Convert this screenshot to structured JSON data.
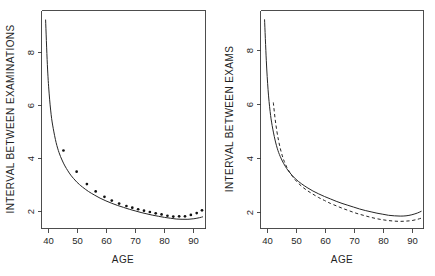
{
  "figure": {
    "kind": "two-panel-scatter-line-plot",
    "background_color": "#ffffff",
    "foreground_color": "#262626",
    "width": 435,
    "height": 276
  },
  "chart_data": [
    {
      "panel": "left",
      "type": "scatter",
      "title": "",
      "xlabel": "AGE",
      "ylabel": "INTERVAL BETWEEN EXAMINATIONS",
      "xlim": [
        36,
        92
      ],
      "ylim": [
        1.55,
        9.6
      ],
      "xticks": [
        40,
        50,
        60,
        70,
        80,
        90
      ],
      "yticks": [
        2,
        4,
        6,
        8
      ],
      "xtick_labels": [
        "40",
        "50",
        "60",
        "70",
        "80",
        "90"
      ],
      "ytick_labels": [
        "2",
        "4",
        "6",
        "8"
      ],
      "grid": false,
      "legend": "none",
      "series": [
        {
          "name": "fitted curve",
          "style": "solid-line",
          "x": [
            37.4,
            38.0,
            38.6,
            39.3,
            40.0,
            41.0,
            42.0,
            43.0,
            44.0,
            45.0,
            46.0,
            47.0,
            48.0,
            49.0,
            50.0,
            52.0,
            54.0,
            56.0,
            58.0,
            60.0,
            62.0,
            64.0,
            66.0,
            68.0,
            70.0,
            72.0,
            74.0,
            76.0,
            78.0,
            80.0,
            82.0,
            84.0,
            86.0,
            88.0,
            90.0,
            91.0
          ],
          "values": [
            9.25,
            7.6,
            6.55,
            5.75,
            5.25,
            4.72,
            4.35,
            4.08,
            3.86,
            3.68,
            3.52,
            3.39,
            3.27,
            3.17,
            3.08,
            2.92,
            2.79,
            2.67,
            2.57,
            2.48,
            2.4,
            2.33,
            2.26,
            2.2,
            2.14,
            2.09,
            2.04,
            2.0,
            1.96,
            1.93,
            1.9,
            1.89,
            1.89,
            1.91,
            1.95,
            1.98
          ]
        },
        {
          "name": "observed points",
          "style": "points",
          "x": [
            43.5,
            48.0,
            51.5,
            54.5,
            57.5,
            60.0,
            62.5,
            65.0,
            67.0,
            69.0,
            71.0,
            73.0,
            75.0,
            77.0,
            79.0,
            81.0,
            83.0,
            85.0,
            87.0,
            89.0,
            90.8
          ],
          "values": [
            4.43,
            3.65,
            3.19,
            2.92,
            2.72,
            2.58,
            2.47,
            2.38,
            2.32,
            2.26,
            2.21,
            2.16,
            2.11,
            2.07,
            2.02,
            1.99,
            2.0,
            2.0,
            2.05,
            2.12,
            2.22
          ]
        }
      ]
    },
    {
      "panel": "right",
      "type": "line",
      "title": "",
      "xlabel": "AGE",
      "ylabel": "INTERVAL BETWEEN EXAMS",
      "xlim": [
        36,
        92
      ],
      "ylim": [
        1.35,
        9.6
      ],
      "xticks": [
        40,
        50,
        60,
        70,
        80,
        90
      ],
      "yticks": [
        2,
        4,
        6,
        8
      ],
      "xtick_labels": [
        "40",
        "50",
        "60",
        "70",
        "80",
        "90"
      ],
      "ytick_labels": [
        "2",
        "4",
        "6",
        "8"
      ],
      "grid": false,
      "legend": "none",
      "series": [
        {
          "name": "solid curve",
          "style": "solid-line",
          "x": [
            37.4,
            38.0,
            38.6,
            39.3,
            40.0,
            41.0,
            42.0,
            43.0,
            44.0,
            45.0,
            46.0,
            48.0,
            50.0,
            52.0,
            54.0,
            56.0,
            58.0,
            60.0,
            62.0,
            64.0,
            66.0,
            68.0,
            70.0,
            72.0,
            74.0,
            76.0,
            78.0,
            80.0,
            82.0,
            84.0,
            86.0,
            88.0,
            90.0,
            91.2
          ],
          "values": [
            9.25,
            7.7,
            6.6,
            5.78,
            5.25,
            4.7,
            4.3,
            4.02,
            3.8,
            3.62,
            3.47,
            3.23,
            3.05,
            2.9,
            2.77,
            2.66,
            2.56,
            2.47,
            2.38,
            2.3,
            2.23,
            2.16,
            2.09,
            2.03,
            1.98,
            1.93,
            1.89,
            1.85,
            1.83,
            1.82,
            1.83,
            1.87,
            1.94,
            2.0
          ]
        },
        {
          "name": "dashed curve",
          "style": "dashed-line",
          "x": [
            40.4,
            41.0,
            41.6,
            42.2,
            42.8,
            43.5,
            44.2,
            45.0,
            46.0,
            47.0,
            48.0,
            50.0,
            52.0,
            54.0,
            56.0,
            58.0,
            60.0,
            62.0,
            64.0,
            66.0,
            68.0,
            70.0,
            72.0,
            74.0,
            76.0,
            78.0,
            80.0,
            82.0,
            84.0,
            86.0,
            88.0,
            90.0,
            91.2
          ],
          "values": [
            6.12,
            5.52,
            5.05,
            4.68,
            4.38,
            4.1,
            3.88,
            3.68,
            3.48,
            3.32,
            3.18,
            2.96,
            2.79,
            2.65,
            2.52,
            2.41,
            2.3,
            2.21,
            2.12,
            2.04,
            1.96,
            1.89,
            1.83,
            1.77,
            1.72,
            1.68,
            1.65,
            1.63,
            1.62,
            1.63,
            1.65,
            1.7,
            1.74
          ]
        }
      ]
    }
  ],
  "panel_left": {
    "x_axis_title": "AGE",
    "y_axis_title": "INTERVAL BETWEEN EXAMINATIONS",
    "x_tick_labels": [
      "40",
      "50",
      "60",
      "70",
      "80",
      "90"
    ],
    "y_tick_labels": [
      "2",
      "4",
      "6",
      "8"
    ]
  },
  "panel_right": {
    "x_axis_title": "AGE",
    "y_axis_title": "INTERVAL BETWEEN EXAMS",
    "x_tick_labels": [
      "40",
      "50",
      "60",
      "70",
      "80",
      "90"
    ],
    "y_tick_labels": [
      "2",
      "4",
      "6",
      "8"
    ]
  }
}
